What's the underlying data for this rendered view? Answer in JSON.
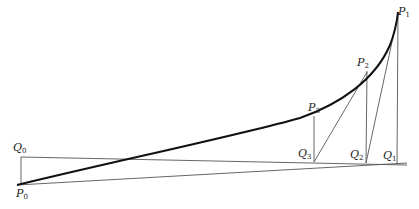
{
  "diagram": {
    "type": "geometric-construction",
    "points": {
      "P0": {
        "label": "P",
        "sub": "0",
        "x": 17,
        "y": 185
      },
      "P1": {
        "label": "P",
        "sub": "1",
        "x": 398,
        "y": 12
      },
      "P2": {
        "label": "P",
        "sub": "2",
        "x": 367,
        "y": 71
      },
      "P3": {
        "label": "P",
        "sub": "3",
        "x": 314,
        "y": 116
      },
      "Q0": {
        "label": "Q",
        "sub": "0",
        "x": 21,
        "y": 157
      },
      "Q1": {
        "label": "Q",
        "sub": "1",
        "x": 397,
        "y": 164
      },
      "Q2": {
        "label": "Q",
        "sub": "2",
        "x": 366,
        "y": 163
      },
      "Q3": {
        "label": "Q",
        "sub": "3",
        "x": 314,
        "y": 162
      }
    },
    "labels": [
      {
        "id": "P0",
        "text": "P",
        "sub": "0"
      },
      {
        "id": "P1",
        "text": "P",
        "sub": "1"
      },
      {
        "id": "P2",
        "text": "P",
        "sub": "2"
      },
      {
        "id": "P3",
        "text": "P",
        "sub": "3"
      },
      {
        "id": "Q0",
        "text": "Q",
        "sub": "0"
      },
      {
        "id": "Q1",
        "text": "Q",
        "sub": "1"
      },
      {
        "id": "Q2",
        "text": "Q",
        "sub": "2"
      },
      {
        "id": "Q3",
        "text": "Q",
        "sub": "3"
      }
    ],
    "colors": {
      "curve": "#111111",
      "line": "#444444"
    }
  }
}
